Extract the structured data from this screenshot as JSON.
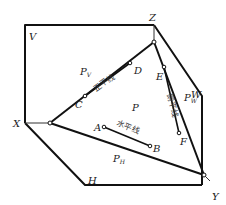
{
  "diagram": {
    "type": "projection-planes",
    "planes": {
      "V": "V",
      "H": "H",
      "W": "W"
    },
    "axes": {
      "X": "X",
      "Y": "Y",
      "Z": "Z"
    },
    "traces": {
      "pv": "P",
      "pv_sub": "V",
      "ph": "P",
      "ph_sub": "H",
      "pw": "P",
      "pw_sub": "W"
    },
    "plane_label": "P",
    "points": {
      "A": "A",
      "B": "B",
      "C": "C",
      "D": "D",
      "E": "E",
      "F": "F"
    },
    "lines": {
      "horizontal": "水平线",
      "frontal": "正平线",
      "profile": "侧平线"
    },
    "line_color": "#111111",
    "background": "#ffffff"
  }
}
